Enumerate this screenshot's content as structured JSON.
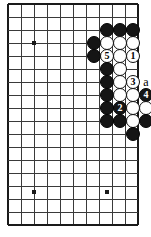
{
  "diagram": {
    "kind": "go-board-problem-diagram",
    "board": {
      "cell": 13,
      "origin_x": 8,
      "origin_y": 4,
      "cols": 11,
      "rows": 18,
      "edges": {
        "left": true,
        "top": true,
        "right": true,
        "bottom": true
      },
      "line_color": "#3a3a3a",
      "edge_color": "#1a1a1a",
      "background": "#ffffff"
    },
    "star_points": [
      {
        "name": "star-point-upper-left",
        "x": 34,
        "y": 43
      },
      {
        "name": "star-point-lower-left",
        "x": 34,
        "y": 192
      },
      {
        "name": "star-point-lower-right",
        "x": 107,
        "y": 192
      }
    ],
    "stone_radius": 7.2,
    "stones": [
      {
        "id": "b1",
        "color": "black",
        "x": 107,
        "y": 30,
        "label": ""
      },
      {
        "id": "b2",
        "color": "black",
        "x": 120,
        "y": 30,
        "label": ""
      },
      {
        "id": "b3",
        "color": "black",
        "x": 133,
        "y": 30,
        "label": ""
      },
      {
        "id": "b4",
        "color": "black",
        "x": 94,
        "y": 43,
        "label": ""
      },
      {
        "id": "w1",
        "color": "white",
        "x": 107,
        "y": 43,
        "label": ""
      },
      {
        "id": "w2",
        "color": "white",
        "x": 120,
        "y": 43,
        "label": ""
      },
      {
        "id": "w3",
        "color": "white",
        "x": 133,
        "y": 43,
        "label": ""
      },
      {
        "id": "b5",
        "color": "black",
        "x": 94,
        "y": 56,
        "label": ""
      },
      {
        "id": "w4",
        "color": "white",
        "x": 107,
        "y": 56,
        "label": "5"
      },
      {
        "id": "w5",
        "color": "white",
        "x": 120,
        "y": 56,
        "label": ""
      },
      {
        "id": "w6",
        "color": "white",
        "x": 133,
        "y": 56,
        "label": "1"
      },
      {
        "id": "b6",
        "color": "black",
        "x": 107,
        "y": 69,
        "label": ""
      },
      {
        "id": "w7",
        "color": "white",
        "x": 120,
        "y": 69,
        "label": ""
      },
      {
        "id": "b7",
        "color": "black",
        "x": 107,
        "y": 82,
        "label": ""
      },
      {
        "id": "w8",
        "color": "white",
        "x": 120,
        "y": 82,
        "label": ""
      },
      {
        "id": "w9",
        "color": "white",
        "x": 133,
        "y": 82,
        "label": "3"
      },
      {
        "id": "b8",
        "color": "black",
        "x": 107,
        "y": 95,
        "label": ""
      },
      {
        "id": "w10",
        "color": "white",
        "x": 120,
        "y": 95,
        "label": ""
      },
      {
        "id": "w11",
        "color": "white",
        "x": 133,
        "y": 95,
        "label": ""
      },
      {
        "id": "b9",
        "color": "black",
        "x": 146,
        "y": 95,
        "label": "4"
      },
      {
        "id": "b10",
        "color": "black",
        "x": 107,
        "y": 108,
        "label": ""
      },
      {
        "id": "b11",
        "color": "black",
        "x": 120,
        "y": 108,
        "label": "2"
      },
      {
        "id": "w12",
        "color": "white",
        "x": 133,
        "y": 108,
        "label": ""
      },
      {
        "id": "w13",
        "color": "white",
        "x": 146,
        "y": 108,
        "label": ""
      },
      {
        "id": "b12",
        "color": "black",
        "x": 107,
        "y": 121,
        "label": ""
      },
      {
        "id": "b13",
        "color": "black",
        "x": 120,
        "y": 121,
        "label": ""
      },
      {
        "id": "w14",
        "color": "white",
        "x": 133,
        "y": 121,
        "label": ""
      },
      {
        "id": "b14",
        "color": "black",
        "x": 146,
        "y": 121,
        "label": ""
      },
      {
        "id": "b15",
        "color": "black",
        "x": 133,
        "y": 134,
        "label": ""
      }
    ],
    "markers": [
      {
        "id": "m-a",
        "text": "a",
        "x": 146,
        "y": 82,
        "name": "board-marker-a"
      }
    ],
    "move_numbers": [
      "1",
      "2",
      "3",
      "4",
      "5"
    ]
  }
}
